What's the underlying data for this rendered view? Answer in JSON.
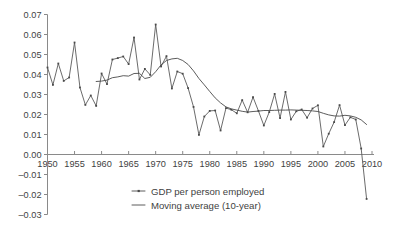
{
  "chart_data": {
    "type": "line",
    "title": "",
    "xlabel": "",
    "ylabel": "",
    "xlim": [
      1950,
      2010
    ],
    "ylim": [
      -0.03,
      0.07
    ],
    "grid": false,
    "legend_position": "bottom-center",
    "y_ticks": [
      "0.07",
      "0.06",
      "0.05",
      "0.04",
      "0.03",
      "0.02",
      "0.01",
      "0.00",
      "–0.01",
      "–0.02",
      "–0.03"
    ],
    "y_tick_values": [
      0.07,
      0.06,
      0.05,
      0.04,
      0.03,
      0.02,
      0.01,
      0.0,
      -0.01,
      -0.02,
      -0.03
    ],
    "x_ticks": [
      "1950",
      "1955",
      "1960",
      "1965",
      "1970",
      "1975",
      "1980",
      "1985",
      "1990",
      "1995",
      "2000",
      "2005",
      "2010"
    ],
    "x_tick_values": [
      1950,
      1955,
      1960,
      1965,
      1970,
      1975,
      1980,
      1985,
      1990,
      1995,
      2000,
      2005,
      2010
    ],
    "x": [
      1950,
      1951,
      1952,
      1953,
      1954,
      1955,
      1956,
      1957,
      1958,
      1959,
      1960,
      1961,
      1962,
      1963,
      1964,
      1965,
      1966,
      1967,
      1968,
      1969,
      1970,
      1971,
      1972,
      1973,
      1974,
      1975,
      1976,
      1977,
      1978,
      1979,
      1980,
      1981,
      1982,
      1983,
      1984,
      1985,
      1986,
      1987,
      1988,
      1989,
      1990,
      1991,
      1992,
      1993,
      1994,
      1995,
      1996,
      1997,
      1998,
      1999,
      2000,
      2001,
      2002,
      2003,
      2004,
      2005,
      2006,
      2007,
      2008,
      2009
    ],
    "series": [
      {
        "name": "GDP per person employed",
        "marker": "point-dash",
        "values": [
          0.0435,
          0.0348,
          0.0455,
          0.0368,
          0.0385,
          0.056,
          0.0335,
          0.0248,
          0.0295,
          0.0243,
          0.0405,
          0.0352,
          0.0475,
          0.0482,
          0.049,
          0.0452,
          0.0585,
          0.0375,
          0.0428,
          0.0398,
          0.065,
          0.044,
          0.0492,
          0.033,
          0.0415,
          0.0404,
          0.0332,
          0.0238,
          0.0098,
          0.019,
          0.0218,
          0.022,
          0.012,
          0.0232,
          0.0224,
          0.0206,
          0.0272,
          0.0211,
          0.0287,
          0.0218,
          0.0145,
          0.0212,
          0.0303,
          0.0182,
          0.0313,
          0.0175,
          0.0216,
          0.0225,
          0.0184,
          0.023,
          0.0246,
          0.004,
          0.0104,
          0.0162,
          0.0247,
          0.0147,
          0.0186,
          0.0175,
          0.003,
          -0.0222
        ]
      },
      {
        "name": "Moving average (10-year)",
        "marker": "line",
        "x": [
          1959,
          1960,
          1961,
          1962,
          1963,
          1964,
          1965,
          1966,
          1967,
          1968,
          1969,
          1970,
          1971,
          1972,
          1973,
          1974,
          1975,
          1976,
          1977,
          1978,
          1979,
          1980,
          1981,
          1982,
          1983,
          1984,
          1985,
          1986,
          1987,
          1988,
          1989,
          1990,
          1991,
          1992,
          1993,
          1994,
          1995,
          1996,
          1997,
          1998,
          1999,
          2000,
          2001,
          2002,
          2003,
          2004,
          2005,
          2006,
          2007,
          2008,
          2009
        ],
        "values": [
          0.0365,
          0.0367,
          0.0372,
          0.0384,
          0.0388,
          0.0394,
          0.0392,
          0.0405,
          0.0406,
          0.038,
          0.0386,
          0.0414,
          0.0448,
          0.047,
          0.0478,
          0.0481,
          0.047,
          0.045,
          0.0418,
          0.038,
          0.0348,
          0.0315,
          0.0283,
          0.0258,
          0.0238,
          0.0228,
          0.0222,
          0.0216,
          0.0212,
          0.0215,
          0.0217,
          0.022,
          0.022,
          0.0221,
          0.0222,
          0.0222,
          0.0223,
          0.0222,
          0.0221,
          0.022,
          0.0218,
          0.0215,
          0.0206,
          0.0198,
          0.0193,
          0.0192,
          0.0196,
          0.0193,
          0.0186,
          0.0173,
          0.015
        ]
      }
    ],
    "legend": [
      {
        "label": "GDP per person employed",
        "marker": "point-dash"
      },
      {
        "label": "Moving average (10-year)",
        "marker": "line"
      }
    ],
    "colors": {
      "series_line": "#5a5a5a",
      "average_line": "#4a4a4a",
      "axis": "#8a8a8a",
      "text": "#3f3f3f",
      "background": "#ffffff"
    }
  }
}
